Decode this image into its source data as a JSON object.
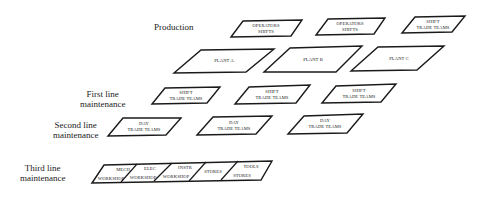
{
  "diagram": {
    "rows": [
      {
        "id": "production",
        "label_lines": [
          "Production"
        ],
        "boxes": [
          {
            "lines": [
              "OPERATORS",
              "SHIFTS"
            ]
          },
          {
            "lines": [
              "OPERATORS",
              "SHIFTS"
            ]
          },
          {
            "lines": [
              "SHIFT",
              "TRADE TEAMS"
            ]
          }
        ]
      },
      {
        "id": "plants",
        "label_lines": [],
        "boxes": [
          {
            "lines": [
              "PLANT A"
            ]
          },
          {
            "lines": [
              "PLANT B"
            ]
          },
          {
            "lines": [
              "PLANT C"
            ]
          }
        ]
      },
      {
        "id": "first-line",
        "label_lines": [
          "First line",
          "maintenance"
        ],
        "boxes": [
          {
            "lines": [
              "SHIFT",
              "TRADE TEAMS"
            ]
          },
          {
            "lines": [
              "SHIFT",
              "TRADE TEAMS"
            ]
          },
          {
            "lines": [
              "SHIFT",
              "TRADE TEAMS"
            ]
          }
        ]
      },
      {
        "id": "second-line",
        "label_lines": [
          "Second line",
          "maintenance"
        ],
        "boxes": [
          {
            "lines": [
              "DAY",
              "TRADE TEAMS"
            ]
          },
          {
            "lines": [
              "DAY",
              "TRADE TEAMS"
            ]
          },
          {
            "lines": [
              "DAY",
              "TRADE TEAMS"
            ]
          }
        ]
      },
      {
        "id": "third-line",
        "label_lines": [
          "Third line",
          "maintenance"
        ],
        "boxes": [
          {
            "lines": [
              "MECH",
              "WORKSHOP"
            ]
          },
          {
            "lines": [
              "ELEC",
              "WORKSHOP"
            ]
          },
          {
            "lines": [
              "INSTR",
              "WORKSHOP"
            ]
          },
          {
            "lines": [
              "STORES"
            ]
          },
          {
            "lines": [
              "TOOLS",
              "STORES"
            ]
          }
        ]
      }
    ],
    "colors": {
      "stroke": "#1a1a1a",
      "text": "#222222",
      "background": "#ffffff"
    }
  }
}
